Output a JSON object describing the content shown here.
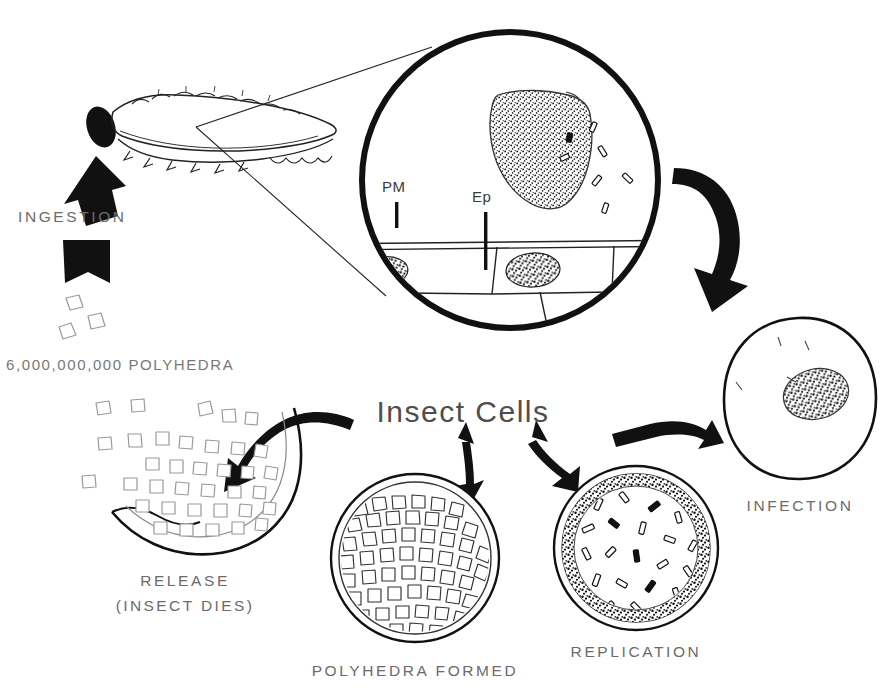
{
  "figure": {
    "title_fragment": "",
    "background_color": "#ffffff",
    "ink_color": "#111111",
    "label_color": "#6b6b6b"
  },
  "labels": {
    "ingestion": "INGESTION",
    "polyhedra_count": "6,000,000,000 POLYHEDRA",
    "pm": "PM",
    "ep": "Ep",
    "insect_cells": "Insect Cells",
    "infection": "INFECTION",
    "replication": "REPLICATION",
    "polyhedra_formed": "POLYHEDRA FORMED",
    "release": "RELEASE",
    "release_sub": "(INSECT DIES)"
  },
  "stages": [
    {
      "id": "ingestion",
      "label": "INGESTION",
      "description": "Larva ingests polyhedral occlusion bodies",
      "order": 1
    },
    {
      "id": "dissolution",
      "label": "PM / Ep",
      "description": "Polyhedra dissolve in midgut releasing virions at peritrophic membrane and epithelium",
      "order": 2
    },
    {
      "id": "infection",
      "label": "INFECTION",
      "description": "Virions infect insect cell, small nucleus",
      "order": 3
    },
    {
      "id": "replication",
      "label": "REPLICATION",
      "description": "Virus replicates, nucleus enlarges and fills with rod virions",
      "order": 4
    },
    {
      "id": "polyhedra-formed",
      "label": "POLYHEDRA FORMED",
      "description": "Nucleus packed with newly formed polyhedra",
      "order": 5
    },
    {
      "id": "release",
      "label": "RELEASE (INSECT DIES)",
      "description": "Polyhedra released from liquefied insect cadaver",
      "order": 6
    }
  ],
  "inset": {
    "pm_label": "PM",
    "ep_label": "Ep",
    "pm_meaning": "peritrophic membrane",
    "ep_meaning": "epithelium"
  }
}
